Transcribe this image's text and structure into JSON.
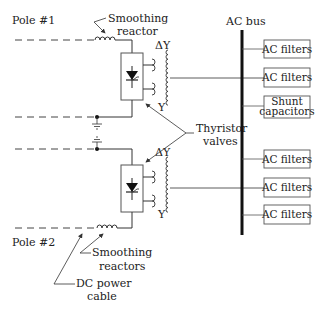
{
  "labels": {
    "pole1": "Pole #1",
    "pole2": "Pole #2",
    "smoothing_reactor": [
      "Smoothing",
      "reactor"
    ],
    "smoothing_reactors": [
      "Smoothing",
      "reactors"
    ],
    "thyristor_valves": [
      "Thyristor",
      "valves"
    ],
    "dc_power_cable": [
      "DC power",
      "cable"
    ],
    "ac_bus": "AC bus",
    "transformer_top": {
      "delta": "Δ",
      "wye": "Y"
    },
    "transformer_bottom": {
      "delta": "Δ",
      "wye": "Y"
    }
  },
  "ac_bus_components": [
    {
      "label": [
        "AC filters"
      ]
    },
    {
      "label": [
        "AC filters"
      ]
    },
    {
      "label": [
        "Shunt",
        "capacitors"
      ]
    },
    {
      "label": [
        "AC filters"
      ]
    },
    {
      "label": [
        "AC filters"
      ]
    },
    {
      "label": [
        "AC filters"
      ]
    }
  ],
  "colors": {
    "line": "#333333",
    "bus": "#111111",
    "box_border": "#555555"
  }
}
